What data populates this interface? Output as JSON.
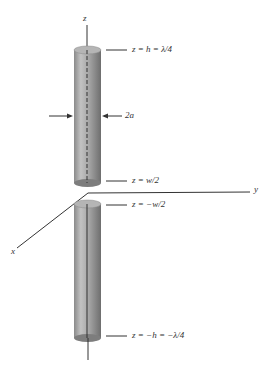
{
  "figure": {
    "axes": {
      "z": "z",
      "y": "y",
      "x": "x"
    },
    "labels": {
      "top": "z = h = λ/4",
      "radius": "2a",
      "gap_top": "z = w/2",
      "gap_bottom": "z = −w/2",
      "bottom": "z = −h = −λ/4"
    },
    "colors": {
      "cylinder_fill": "#a9a9a9",
      "cylinder_dark": "#7d7d7d",
      "line": "#333333"
    }
  }
}
